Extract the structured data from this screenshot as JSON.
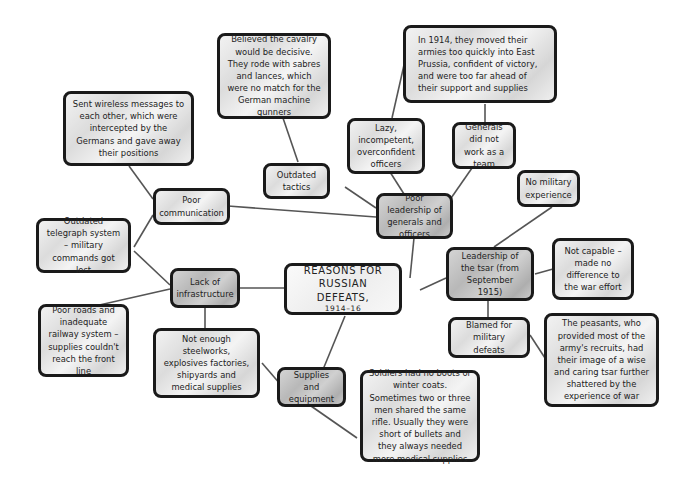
{
  "title": {
    "line1": "REASONS FOR",
    "line2": "RUSSIAN DEFEATS,",
    "years": "1914–16"
  },
  "nodes": {
    "poor_leadership": "Poor leadership of generals and officers",
    "lazy_officers": "Lazy, incompetent, overconfident officers",
    "generals_team": "Generals did not work as a team",
    "east_prussia": "In 1914, they moved their armies too quickly into East Prussia, confident of victory, and were too far ahead of their support and supplies",
    "outdated_tactics": "Outdated tactics",
    "cavalry": "Believed the cavalry would be decisive. They rode with sabres and lances, which were no match for the German machine gunners",
    "poor_communication": "Poor communication",
    "wireless": "Sent wireless messages to each other, which were intercepted by the Germans and gave away their positions",
    "telegraph": "Outdated telegraph system – military commands got lost",
    "lack_infrastructure": "Lack of infrastructure",
    "roads_railway": "Poor roads and inadequate railway system – supplies couldn't reach the front line",
    "steelworks": "Not enough steelworks, explosives factories, shipyards and medical supplies",
    "supplies_equipment": "Supplies and equipment",
    "soldiers": "Soldiers had no boots or winter coats. Sometimes two or three men shared the same rifle. Usually they were short of bullets and they always needed more medical supplies",
    "tsar_leadership": "Leadership of the tsar (from September 1915)",
    "no_experience": "No military experience",
    "not_capable": "Not capable – made no difference to the war effort",
    "blamed": "Blamed for military defeats",
    "peasants": "The peasants, who provided most of the army's recruits, had their image of a wise and caring tsar further shattered by the experience of war"
  },
  "colors": {
    "border": "#1a1a1a",
    "line": "#555555",
    "box_light": "#e6e6e6",
    "box_dark": "#c2c2c2"
  }
}
